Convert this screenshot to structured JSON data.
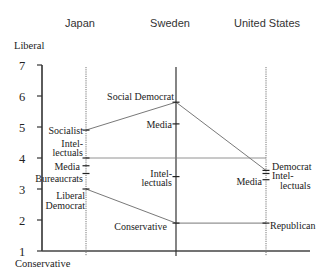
{
  "header": {
    "columns": [
      "Japan",
      "Sweden",
      "United States"
    ]
  },
  "axis": {
    "top_label": "Liberal",
    "bottom_label": "Conservative",
    "ticks": [
      "1",
      "2",
      "3",
      "4",
      "5",
      "6",
      "7"
    ]
  },
  "chart_data": {
    "type": "line",
    "title": "",
    "xlabel": "",
    "ylabel": "Liberal (top) to Conservative (bottom)",
    "ylim": [
      1,
      7
    ],
    "yticks": [
      1,
      2,
      3,
      4,
      5,
      6,
      7
    ],
    "grid": false,
    "legend": "none",
    "categories": [
      "Japan",
      "Sweden",
      "United States"
    ],
    "points": [
      [
        {
          "label": [
            "Socialist"
          ],
          "value": 4.9
        },
        {
          "label": [
            "Intel-",
            "lectuals"
          ],
          "value": 4.0
        },
        {
          "label": [
            "Media"
          ],
          "value": 3.75
        },
        {
          "label": [
            "Bureaucrats"
          ],
          "value": 3.5
        },
        {
          "label": [
            "Liberal",
            "Democrat"
          ],
          "value": 3.0
        }
      ],
      [
        {
          "label": [
            "Social Democrat"
          ],
          "value": 5.8
        },
        {
          "label": [
            "Media"
          ],
          "value": 5.1
        },
        {
          "label": [
            "Intel-",
            "lectuals"
          ],
          "value": 3.4
        },
        {
          "label": [
            "Conservative"
          ],
          "value": 1.9
        }
      ],
      [
        {
          "label": [
            "Democrat"
          ],
          "value": 3.6
        },
        {
          "label": [
            "Intel-",
            "lectuals"
          ],
          "value": 3.5
        },
        {
          "label": [
            "Media"
          ],
          "value": 3.3
        },
        {
          "label": [
            "Republican"
          ],
          "value": 1.9
        }
      ]
    ],
    "series": [
      {
        "name": "Left party (Socialist / Social Democrat / Democrat)",
        "values": [
          4.9,
          5.8,
          3.6
        ]
      },
      {
        "name": "Right party (Liberal Democrat / Conservative / Republican)",
        "values": [
          3.0,
          1.9,
          1.9
        ]
      },
      {
        "name": "Midpoint reference",
        "values": [
          4.0,
          4.0,
          4.0
        ]
      }
    ]
  }
}
